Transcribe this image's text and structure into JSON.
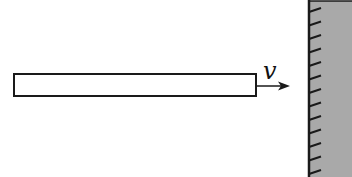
{
  "diagram": {
    "type": "physics-schematic",
    "colors": {
      "background": "#ffffff",
      "stroke": "#1a1a1a",
      "wall_fill": "#a9a9a9",
      "rod_fill": "#ffffff"
    },
    "rod": {
      "x": 14,
      "y": 74,
      "width": 242,
      "height": 22
    },
    "velocity": {
      "label": "v",
      "arrow_from_x": 256,
      "arrow_to_x": 290,
      "arrow_y": 86,
      "label_x": 263,
      "label_y": 79
    },
    "wall": {
      "x": 309,
      "y": 1,
      "width": 43,
      "height": 176,
      "hatch_count": 13,
      "hatch_start_y": 12,
      "hatch_spacing": 13.5,
      "hatch_dx": 12,
      "hatch_dy": -4
    }
  }
}
